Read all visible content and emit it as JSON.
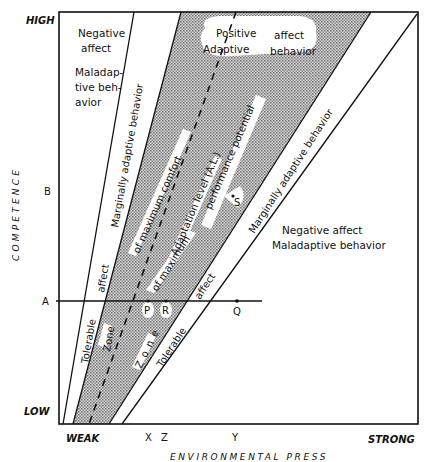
{
  "figure": {
    "y_axis": {
      "title": "COMPETENCE",
      "high_label": "HIGH",
      "low_label": "LOW",
      "markers": [
        "B",
        "A"
      ]
    },
    "x_axis": {
      "title": "ENVIRONMENTAL PRESS",
      "weak_label": "WEAK",
      "strong_label": "STRONG",
      "markers": [
        "X",
        "Z",
        "Y"
      ]
    },
    "regions": {
      "upper_left": {
        "line1": "Negative",
        "line2": "affect",
        "line3": "Maladap-",
        "line4": "tive beh-",
        "line5": "avior"
      },
      "upper_center": {
        "line1a": "Positive",
        "line1b": "affect",
        "line2a": "Adaptive",
        "line2b": "behavior"
      },
      "lower_right": {
        "line1": "Negative affect",
        "line2": "Maladaptive behavior"
      }
    },
    "band_labels": {
      "left_marginal": "Marginally  adaptive  behavior",
      "left_affect": "affect",
      "left_tolerable": "Tolerable",
      "left_zone": "Zone",
      "max_comfort": "of  maximum  comfort",
      "adaptation_level": "Adaptation  level (A.L.)",
      "of_maximum": "of  maximum",
      "performance_potential": "performance  potential",
      "right_zone": "Z o n e",
      "right_tolerable": "Tolerable",
      "right_affect": "affect",
      "right_marginal": "Marginally  adaptive  behavior"
    },
    "points": {
      "P": "P",
      "R": "R",
      "Q": "Q",
      "S": "S"
    }
  }
}
